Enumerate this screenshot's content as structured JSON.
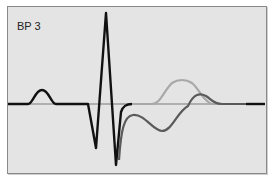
{
  "panel": {
    "label": "BP 3",
    "background": "#e4e4e4",
    "border_color": "#8a8a8a"
  },
  "traces": [
    {
      "name": "baseline",
      "color": "#7a7a7a",
      "description": "horizontal reference line"
    },
    {
      "name": "primary-waveform",
      "color": "#111111",
      "description": "black ECG-like trace with P wave, QRS complex"
    },
    {
      "name": "light-t-wave",
      "color": "#a8a8a8",
      "description": "light gray upright T wave"
    },
    {
      "name": "dark-t-wave",
      "color": "#5a5a5a",
      "description": "dark gray biphasic T wave"
    }
  ]
}
